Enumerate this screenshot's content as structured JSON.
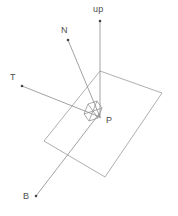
{
  "figure": {
    "background_color": "#ffffff",
    "line_color": "#8a8a8a",
    "label_color": "#4d4d4d",
    "width": 178,
    "height": 216
  },
  "labels": {
    "up": "up",
    "normal": "N",
    "tangent": "T",
    "point": "P",
    "bitangent": "B"
  },
  "chart_data": {
    "type": "diagram",
    "origin": {
      "name": "P",
      "x": 100,
      "y": 116
    },
    "vectors": [
      {
        "name": "up",
        "label": "up",
        "from": [
          100,
          118
        ],
        "to": [
          100,
          21
        ],
        "tip_dot": true
      },
      {
        "name": "N",
        "label": "N",
        "from": [
          100,
          117
        ],
        "to": [
          68,
          40
        ],
        "tip_dot": true
      },
      {
        "name": "T",
        "label": "T",
        "from": [
          100,
          117
        ],
        "to": [
          22,
          86
        ],
        "tip_dot": true
      },
      {
        "name": "B",
        "label": "B",
        "from": [
          99,
          114
        ],
        "to": [
          36,
          196
        ],
        "tip_dot": true
      }
    ],
    "plane": {
      "name": "surface-plane",
      "corners": [
        [
          100,
          71
        ],
        [
          162,
          93
        ],
        [
          105,
          177
        ],
        [
          44,
          141
        ]
      ]
    },
    "frame_box": {
      "name": "tangent-frame-cube",
      "comment": "small skewed parallelepiped drawn at the origin showing the TBN basis",
      "top_face": [
        [
          88,
          104
        ],
        [
          97,
          101
        ],
        [
          102,
          108
        ],
        [
          93,
          111
        ]
      ],
      "bottom_face": [
        [
          84,
          114
        ],
        [
          93,
          111
        ],
        [
          98,
          118
        ],
        [
          89,
          121
        ]
      ],
      "vertical_edges": [
        [
          [
            88,
            104
          ],
          [
            84,
            114
          ]
        ],
        [
          [
            97,
            101
          ],
          [
            93,
            111
          ]
        ],
        [
          [
            102,
            108
          ],
          [
            98,
            118
          ]
        ],
        [
          [
            93,
            111
          ],
          [
            89,
            121
          ]
        ]
      ]
    },
    "axis_ranges": {
      "x": [
        0,
        178
      ],
      "y": [
        0,
        216
      ]
    },
    "grid": false,
    "legend": null
  }
}
